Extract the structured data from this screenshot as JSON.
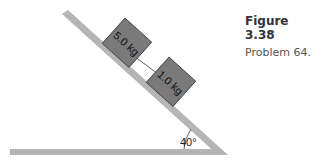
{
  "figure": {
    "title": "Figure 3.38",
    "subtitle": "Problem 64."
  },
  "diagram": {
    "incline_angle_label": "40°",
    "blocks": [
      {
        "label": "5.0 kg"
      },
      {
        "label": "1.0 kg"
      }
    ],
    "colors": {
      "surface": "#b5b5b5",
      "block_fill": "#7a7a7a",
      "block_stroke": "#333333",
      "rope": "#333333"
    }
  }
}
